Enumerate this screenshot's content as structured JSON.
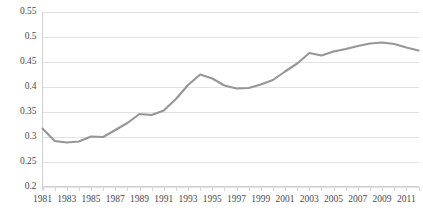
{
  "chart_data": {
    "type": "line",
    "title": "",
    "subtitle": "",
    "xlabel": "",
    "ylabel": "",
    "grid": "horizontal",
    "legend": "none",
    "xlim": [
      1981,
      2012
    ],
    "ylim": [
      0.2,
      0.55
    ],
    "y_ticks": [
      "0.2",
      "0.25",
      "0.3",
      "0.35",
      "0.4",
      "0.45",
      "0.5",
      "0.55"
    ],
    "y_tick_values": [
      0.2,
      0.25,
      0.3,
      0.35,
      0.4,
      0.45,
      0.5,
      0.55
    ],
    "x_tick_labels": [
      "1981",
      "1983",
      "1985",
      "1987",
      "1989",
      "1991",
      "1993",
      "1995",
      "1997",
      "1999",
      "2001",
      "2003",
      "2005",
      "2007",
      "2009",
      "2011"
    ],
    "x_tick_values": [
      1981,
      1983,
      1985,
      1987,
      1989,
      1991,
      1993,
      1995,
      1997,
      1999,
      2001,
      2003,
      2005,
      2007,
      2009,
      2011
    ],
    "x": [
      1981,
      1982,
      1983,
      1984,
      1985,
      1986,
      1987,
      1988,
      1989,
      1990,
      1991,
      1992,
      1993,
      1994,
      1995,
      1996,
      1997,
      1998,
      1999,
      2000,
      2001,
      2002,
      2003,
      2004,
      2005,
      2006,
      2007,
      2008,
      2009,
      2010,
      2011,
      2012
    ],
    "series": [
      {
        "name": "Series 1",
        "color": "#969696",
        "values": [
          0.316,
          0.291,
          0.288,
          0.29,
          0.3,
          0.299,
          0.313,
          0.327,
          0.345,
          0.343,
          0.352,
          0.375,
          0.403,
          0.424,
          0.416,
          0.402,
          0.396,
          0.397,
          0.404,
          0.413,
          0.43,
          0.446,
          0.467,
          0.462,
          0.47,
          0.475,
          0.481,
          0.486,
          0.488,
          0.485,
          0.478,
          0.472
        ]
      }
    ]
  }
}
